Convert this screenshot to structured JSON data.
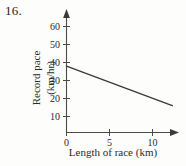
{
  "problem": {
    "number": "16."
  },
  "chart_data": {
    "type": "line",
    "title": "",
    "xlabel": "Length of race (km)",
    "ylabel": "Record pace (km/hr)",
    "ylabel_lines": [
      "Record pace",
      "(km/hr)"
    ],
    "xlim": [
      0,
      13
    ],
    "ylim": [
      0,
      65
    ],
    "xticks": [
      0,
      5,
      10
    ],
    "xticklabels": [
      "0",
      "5",
      "10"
    ],
    "yticks": [
      10,
      20,
      30,
      40,
      50,
      60
    ],
    "yticklabels": [
      "10",
      "20",
      "30",
      "40",
      "50",
      "60"
    ],
    "grid": false,
    "legend": null,
    "axis_arrows": {
      "x": "right",
      "y": "up"
    },
    "series": [
      {
        "name": "record pace",
        "color": "#3a3a3a",
        "x": [
          0,
          12.3
        ],
        "y": [
          38,
          16
        ]
      }
    ]
  },
  "colors": {
    "background": "#fdfdfb",
    "axis": "#4a4a4a",
    "line": "#3a3a3a",
    "text": "#2b2b2b"
  },
  "icons": {
    "x_axis_arrow": "arrow-right-icon",
    "y_axis_arrow": "arrow-up-icon"
  }
}
